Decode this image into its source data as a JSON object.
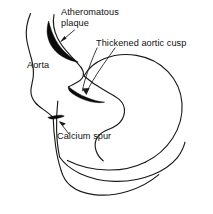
{
  "figure": {
    "type": "medical-line-drawing",
    "background_color": "#ffffff",
    "ink_color": "#1a1a1a",
    "lesion_fill_color": "#0a0a0a"
  },
  "labels": {
    "atheromatous_plaque": {
      "line1": "Atheromatous",
      "line2": "plaque"
    },
    "thickened_aortic_cusp": {
      "text": "Thickened aortic cusp"
    },
    "aorta": {
      "text": "Aorta"
    },
    "calcium_spur": {
      "text": "Calcium spur"
    }
  },
  "structures": [
    {
      "name": "aorta",
      "kind": "outline",
      "description": "Tubular vessel descending from upper left toward the aortic root"
    },
    {
      "name": "atheromatous-plaque",
      "kind": "filled-lesion",
      "description": "Black crescentic thickening along the aortic wall"
    },
    {
      "name": "thickened-aortic-cusp",
      "kind": "filled-lesion",
      "description": "Black elongated crescent at the aortic valve cusp"
    },
    {
      "name": "calcium-spur",
      "kind": "filled-lesion",
      "description": "Small black triangular projection at the valve annulus"
    },
    {
      "name": "heart-body",
      "kind": "outline",
      "description": "Scalloped cardiac silhouette with ventricular lobes"
    }
  ]
}
